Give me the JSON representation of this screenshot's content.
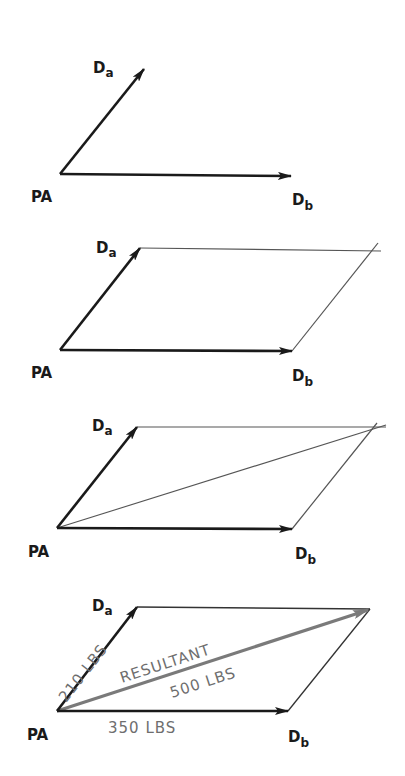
{
  "figure": {
    "colors": {
      "vector": "#1a1a1a",
      "construction_line": "#555555",
      "resultant": "#7a7a7a",
      "magnitude_text": "#6e6e6e"
    },
    "labels": {
      "origin": "PA",
      "vector_a_main": "D",
      "vector_a_sub": "a",
      "vector_b_main": "D",
      "vector_b_sub": "b"
    },
    "steps": [
      {
        "step": 1,
        "title": "Two vectors from common origin"
      },
      {
        "step": 2,
        "title": "Construct parallelogram sides"
      },
      {
        "step": 3,
        "title": "Draw diagonal"
      },
      {
        "step": 4,
        "title": "Resultant with magnitudes"
      }
    ],
    "magnitudes": {
      "vector_a": "210 LBS",
      "vector_b": "350 LBS",
      "resultant_label": "RESULTANT",
      "resultant_value": "500 LBS"
    }
  }
}
